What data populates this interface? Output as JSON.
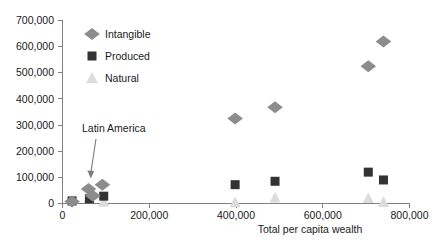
{
  "chart_data": {
    "type": "scatter",
    "title": "",
    "xlabel": "Total per capita wealth",
    "ylabel": "",
    "xlim": [
      0,
      800000
    ],
    "ylim": [
      0,
      700000
    ],
    "grid": false,
    "legend_position": "top-left-inside",
    "xticks": [
      0,
      200000,
      400000,
      600000,
      800000
    ],
    "xtick_labels": [
      "0",
      "200,000",
      "400,000",
      "600,000",
      "800,000"
    ],
    "yticks": [
      0,
      100000,
      200000,
      300000,
      400000,
      500000,
      600000,
      700000
    ],
    "ytick_labels": [
      "0",
      "100,000",
      "200,000",
      "300,000",
      "400,000",
      "500,000",
      "600,000",
      "700,000"
    ],
    "annotations": [
      {
        "text": "Latin America",
        "x": 155000,
        "y": 290000,
        "points_to_x": 62000,
        "points_to_y": 92000
      }
    ],
    "series": [
      {
        "name": "Intangible",
        "marker": "diamond",
        "color": "#8c8c8c",
        "points": [
          {
            "x": 22000,
            "y": 8000
          },
          {
            "x": 60000,
            "y": 55000
          },
          {
            "x": 70000,
            "y": 30000
          },
          {
            "x": 92000,
            "y": 72000
          },
          {
            "x": 398000,
            "y": 325000
          },
          {
            "x": 490000,
            "y": 368000
          },
          {
            "x": 705000,
            "y": 525000
          },
          {
            "x": 740000,
            "y": 620000
          }
        ]
      },
      {
        "name": "Produced",
        "marker": "square",
        "color": "#333333",
        "points": [
          {
            "x": 22000,
            "y": 10000
          },
          {
            "x": 62000,
            "y": 18000
          },
          {
            "x": 95000,
            "y": 28000
          },
          {
            "x": 398000,
            "y": 72000
          },
          {
            "x": 490000,
            "y": 85000
          },
          {
            "x": 705000,
            "y": 120000
          },
          {
            "x": 740000,
            "y": 90000
          }
        ]
      },
      {
        "name": "Natural",
        "marker": "triangle",
        "color": "#dcdcdc",
        "points": [
          {
            "x": 22000,
            "y": 9000
          },
          {
            "x": 62000,
            "y": 22000
          },
          {
            "x": 95000,
            "y": 6000
          },
          {
            "x": 398000,
            "y": 4000
          },
          {
            "x": 490000,
            "y": 22000
          },
          {
            "x": 705000,
            "y": 20000
          },
          {
            "x": 740000,
            "y": 5000
          }
        ]
      }
    ]
  },
  "legend": {
    "items": [
      {
        "label": "Intangible",
        "marker": "diamond",
        "color": "#8c8c8c"
      },
      {
        "label": "Produced",
        "marker": "square",
        "color": "#333333"
      },
      {
        "label": "Natural",
        "marker": "triangle",
        "color": "#dcdcdc"
      }
    ]
  },
  "axes": {
    "x_title": "Total per capita wealth"
  }
}
